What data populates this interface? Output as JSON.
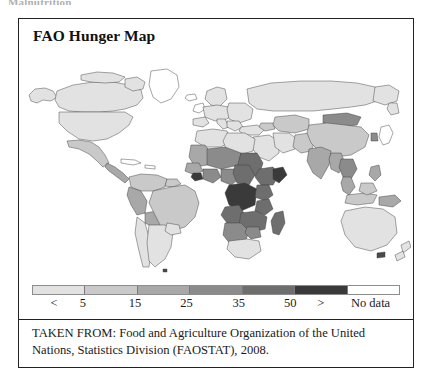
{
  "page_header": "Malnutrition",
  "figure": {
    "title": "FAO Hunger Map",
    "caption": "TAKEN FROM: Food and Agriculture Organization of the United Nations, Statistics Division (FAOSTAT), 2008."
  },
  "legend": {
    "swatch_colors": [
      "#e2e2e2",
      "#c9c9c9",
      "#a8a8a8",
      "#8b8b8b",
      "#6e6e6e",
      "#3a3a3a",
      "#ffffff"
    ],
    "labels": [
      {
        "text": "<",
        "x_pct": 6.0
      },
      {
        "text": "5",
        "x_pct": 13.8
      },
      {
        "text": "15",
        "x_pct": 28.0
      },
      {
        "text": "25",
        "x_pct": 42.0
      },
      {
        "text": "35",
        "x_pct": 56.2
      },
      {
        "text": "50",
        "x_pct": 70.2
      },
      {
        "text": ">",
        "x_pct": 78.5
      },
      {
        "text": "No data",
        "x_pct": 92.0
      }
    ]
  },
  "chart_data": {
    "type": "heatmap",
    "title": "FAO Hunger Map",
    "subtitle": "",
    "xlabel": "",
    "ylabel": "",
    "legend_position": "bottom",
    "grid": false,
    "units": "percent of population undernourished",
    "source": "Food and Agriculture Organization of the United Nations, Statistics Division (FAOSTAT), 2008",
    "class_breaks": [
      {
        "label": "< 5",
        "min": 0,
        "max": 5,
        "color": "#e2e2e2"
      },
      {
        "label": "5 - 15",
        "min": 5,
        "max": 15,
        "color": "#c9c9c9"
      },
      {
        "label": "15 - 25",
        "min": 15,
        "max": 25,
        "color": "#a8a8a8"
      },
      {
        "label": "25 - 35",
        "min": 25,
        "max": 35,
        "color": "#8b8b8b"
      },
      {
        "label": "35 - 50",
        "min": 35,
        "max": 50,
        "color": "#6e6e6e"
      },
      {
        "label": "> 50",
        "min": 50,
        "max": 100,
        "color": "#3a3a3a"
      },
      {
        "label": "No data",
        "min": null,
        "max": null,
        "color": "#ffffff"
      }
    ],
    "regions": [
      {
        "name": "Canada",
        "class": "< 5",
        "color": "#e2e2e2"
      },
      {
        "name": "United States",
        "class": "< 5",
        "color": "#e2e2e2"
      },
      {
        "name": "Greenland",
        "class": "No data",
        "color": "#ffffff"
      },
      {
        "name": "Mexico",
        "class": "5 - 15",
        "color": "#c9c9c9"
      },
      {
        "name": "Central America",
        "class": "15 - 25",
        "color": "#a8a8a8"
      },
      {
        "name": "Caribbean",
        "class": "No data",
        "color": "#ffffff"
      },
      {
        "name": "Colombia / Venezuela",
        "class": "5 - 15",
        "color": "#c9c9c9"
      },
      {
        "name": "Peru / Bolivia",
        "class": "15 - 25",
        "color": "#a8a8a8"
      },
      {
        "name": "Brazil",
        "class": "5 - 15",
        "color": "#c9c9c9"
      },
      {
        "name": "Argentina / Chile / Uruguay",
        "class": "< 5",
        "color": "#e2e2e2"
      },
      {
        "name": "Western Europe",
        "class": "< 5",
        "color": "#e2e2e2"
      },
      {
        "name": "Eastern Europe",
        "class": "< 5",
        "color": "#e2e2e2"
      },
      {
        "name": "Russian Federation",
        "class": "< 5",
        "color": "#e2e2e2"
      },
      {
        "name": "North Africa",
        "class": "< 5",
        "color": "#e2e2e2"
      },
      {
        "name": "West Africa (Sahel)",
        "class": "15 - 25",
        "color": "#a8a8a8"
      },
      {
        "name": "Central Africa",
        "class": "> 50",
        "color": "#3a3a3a"
      },
      {
        "name": "Horn of Africa",
        "class": "35 - 50",
        "color": "#6e6e6e"
      },
      {
        "name": "East Africa",
        "class": "35 - 50",
        "color": "#6e6e6e"
      },
      {
        "name": "Southern Africa",
        "class": "25 - 35",
        "color": "#8b8b8b"
      },
      {
        "name": "South Africa",
        "class": "< 5",
        "color": "#e2e2e2"
      },
      {
        "name": "Madagascar",
        "class": "35 - 50",
        "color": "#6e6e6e"
      },
      {
        "name": "Middle East",
        "class": "< 5",
        "color": "#e2e2e2"
      },
      {
        "name": "Central Asia",
        "class": "5 - 15",
        "color": "#c9c9c9"
      },
      {
        "name": "India",
        "class": "15 - 25",
        "color": "#a8a8a8"
      },
      {
        "name": "China",
        "class": "5 - 15",
        "color": "#c9c9c9"
      },
      {
        "name": "Mongolia",
        "class": "25 - 35",
        "color": "#8b8b8b"
      },
      {
        "name": "Southeast Asia",
        "class": "15 - 25",
        "color": "#a8a8a8"
      },
      {
        "name": "Cambodia / Laos",
        "class": "25 - 35",
        "color": "#8b8b8b"
      },
      {
        "name": "Indonesia",
        "class": "5 - 15",
        "color": "#c9c9c9"
      },
      {
        "name": "Japan",
        "class": "No data",
        "color": "#ffffff"
      },
      {
        "name": "Australia",
        "class": "< 5",
        "color": "#e2e2e2"
      },
      {
        "name": "New Zealand",
        "class": "< 5",
        "color": "#e2e2e2"
      },
      {
        "name": "Papua New Guinea",
        "class": "15 - 25",
        "color": "#a8a8a8"
      }
    ]
  }
}
